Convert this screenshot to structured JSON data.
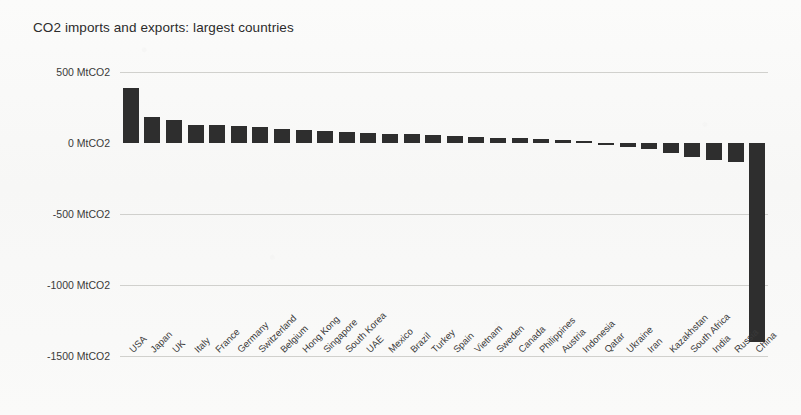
{
  "chart_data": {
    "type": "bar",
    "title": "CO2 imports and exports: largest countries",
    "xlabel": "",
    "ylabel": "MtCO2",
    "ylim": [
      -1500,
      500
    ],
    "yticks": [
      500,
      0,
      -500,
      -1000,
      -1500
    ],
    "ytick_labels": [
      "500 MtCO2",
      "0 MtCO2",
      "-500 MtCO2",
      "-1000 MtCO2",
      "-1500 MtCO2"
    ],
    "grid": true,
    "legend": null,
    "bar_color": "#2e2e2e",
    "categories": [
      "USA",
      "Japan",
      "UK",
      "Italy",
      "France",
      "Germany",
      "Switzerland",
      "Belgium",
      "Hong Kong",
      "Singapore",
      "South Korea",
      "UAE",
      "Mexico",
      "Brazil",
      "Turkey",
      "Spain",
      "Vietnam",
      "Sweden",
      "Canada",
      "Philippines",
      "Austria",
      "Indonesia",
      "Qatar",
      "Ukraine",
      "Iran",
      "Kazakhstan",
      "South Africa",
      "India",
      "Russia",
      "China"
    ],
    "values": [
      390,
      185,
      165,
      130,
      125,
      120,
      110,
      100,
      95,
      85,
      80,
      72,
      66,
      60,
      55,
      50,
      44,
      38,
      32,
      26,
      20,
      12,
      -14,
      -26,
      -44,
      -70,
      -100,
      -118,
      -135,
      -1400
    ]
  },
  "background": {
    "bleed_through_text": "scan artifact"
  }
}
